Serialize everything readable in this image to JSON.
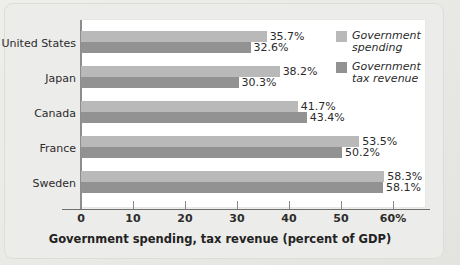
{
  "chart_data": {
    "type": "bar",
    "orientation": "horizontal",
    "title": "",
    "xlabel": "Government spending, tax revenue (percent of GDP)",
    "ylabel": "",
    "xlim": [
      0,
      65
    ],
    "xticks": [
      0,
      10,
      20,
      30,
      40,
      50,
      60
    ],
    "xtick_labels": [
      "0",
      "10",
      "20",
      "30",
      "40",
      "50",
      "60%"
    ],
    "grid": false,
    "legend_position": "right-inside",
    "categories": [
      "United States",
      "Japan",
      "Canada",
      "France",
      "Sweden"
    ],
    "series": [
      {
        "name": "Government spending",
        "color": "#b9b9b9",
        "values": [
          35.7,
          38.2,
          41.7,
          53.5,
          58.3
        ],
        "labels": [
          "35.7%",
          "38.2%",
          "41.7%",
          "53.5%",
          "58.3%"
        ]
      },
      {
        "name": "Government tax revenue",
        "color": "#929292",
        "values": [
          32.6,
          30.3,
          43.4,
          50.2,
          58.1
        ],
        "labels": [
          "32.6%",
          "30.3%",
          "43.4%",
          "50.2%",
          "58.1%"
        ]
      }
    ]
  },
  "legend": {
    "items": [
      {
        "label_line1": "Government",
        "label_line2": "spending",
        "swatch": "spending"
      },
      {
        "label_line1": "Government",
        "label_line2": "tax revenue",
        "swatch": "revenue"
      }
    ]
  },
  "colors": {
    "spending": "#b9b9b9",
    "revenue": "#929292",
    "panel": "#ffffff",
    "background": "#ececea",
    "axis": "#8b8b8b",
    "text": "#2b2b2b"
  }
}
